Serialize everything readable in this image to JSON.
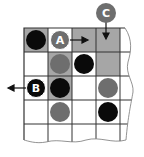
{
  "diagram": {
    "type": "board-game-diagram",
    "grid": {
      "cols": 5,
      "rows": 5,
      "cell_size": 24,
      "origin_x": 24,
      "origin_y": 28,
      "torn_edges": [
        "right",
        "bottom"
      ]
    },
    "colors": {
      "highlight_cell": "#a6a6a6",
      "empty_cell": "#ffffff",
      "grid_line": "#333333",
      "black_disc": "#0a0a0a",
      "gray_disc": "#6e6e6e",
      "label_text": "#ffffff"
    },
    "highlighted_cells": [
      [
        0,
        0
      ],
      [
        0,
        2
      ],
      [
        0,
        3
      ],
      [
        1,
        1
      ],
      [
        1,
        3
      ],
      [
        2,
        1
      ]
    ],
    "discs": [
      {
        "row": 0,
        "col": 0,
        "color": "black",
        "label": ""
      },
      {
        "row": 0,
        "col": 1,
        "color": "gray",
        "label": "A"
      },
      {
        "row": 1,
        "col": 1,
        "color": "gray",
        "label": ""
      },
      {
        "row": 1,
        "col": 2,
        "color": "black",
        "label": ""
      },
      {
        "row": 2,
        "col": 0,
        "color": "black",
        "label": "B"
      },
      {
        "row": 2,
        "col": 1,
        "color": "black",
        "label": ""
      },
      {
        "row": 2,
        "col": 3,
        "color": "gray",
        "label": ""
      },
      {
        "row": 3,
        "col": 1,
        "color": "gray",
        "label": ""
      },
      {
        "row": 3,
        "col": 3,
        "color": "black",
        "label": ""
      }
    ],
    "callouts": [
      {
        "label": "C",
        "color": "gray",
        "x": 96,
        "y": 3,
        "arrow": "down",
        "target": "row 0, col 3"
      }
    ],
    "arrows": [
      {
        "from": "A",
        "direction": "right",
        "target": "row 0, col 2"
      },
      {
        "from": "B",
        "direction": "left",
        "target": "off-board left"
      },
      {
        "from": "C",
        "direction": "down",
        "target": "row 0, col 3"
      }
    ],
    "labels": {
      "a": "A",
      "b": "B",
      "c": "C"
    }
  }
}
